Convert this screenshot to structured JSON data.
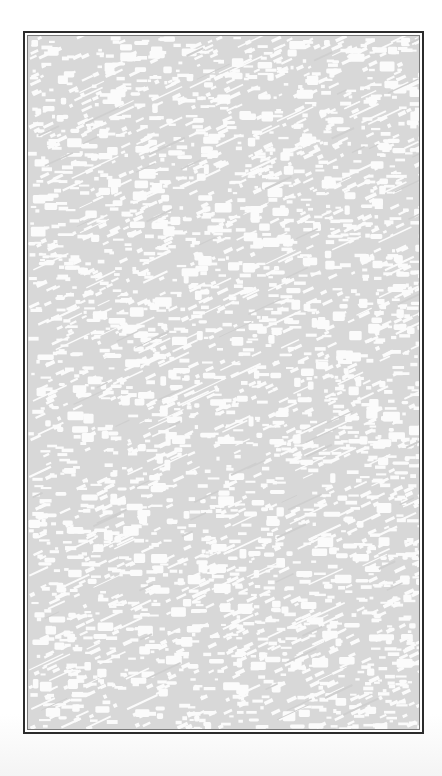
{
  "frame": {
    "label": "",
    "border_color": "#2b2b2b",
    "inner_line_color": "#7a7a7a"
  },
  "texture": {
    "kind": "dithered-noise",
    "base_color": "#d8d8d8",
    "highlight_color": "#fbfbfb",
    "streak_angle_deg": -25,
    "seed": 1337,
    "dash_count": 2600,
    "blob_count": 520,
    "streak_count": 260
  }
}
